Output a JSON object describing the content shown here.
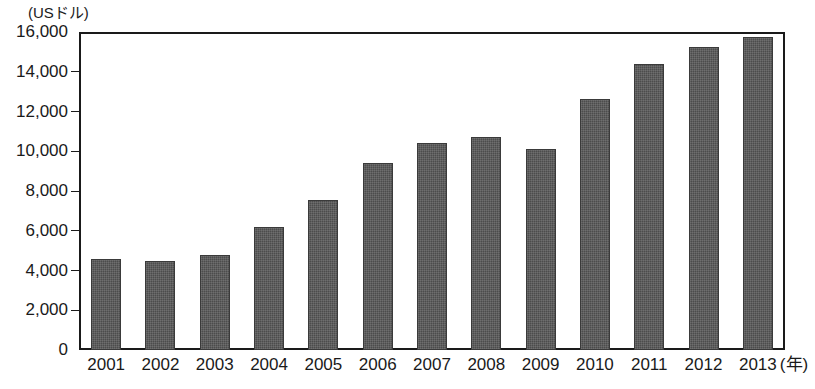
{
  "chart_data": {
    "type": "bar",
    "title": "【世界の人口動態と経済成長の推移】",
    "title_visible": false,
    "ylabel": "(USドル)",
    "xlabel": "(年)",
    "categories": [
      "2001",
      "2002",
      "2003",
      "2004",
      "2005",
      "2006",
      "2007",
      "2008",
      "2009",
      "2010",
      "2011",
      "2012",
      "2013"
    ],
    "values": [
      4600,
      4500,
      4800,
      6200,
      7550,
      9400,
      10400,
      10700,
      10100,
      12650,
      14400,
      15250,
      15750
    ],
    "ylim": [
      0,
      16000
    ],
    "ytick_values": [
      0,
      2000,
      4000,
      6000,
      8000,
      10000,
      12000,
      14000,
      16000
    ],
    "ytick_labels": [
      "0",
      "2,000",
      "4,000",
      "6,000",
      "8,000",
      "10,000",
      "12,000",
      "14,000",
      "16,000"
    ],
    "grid": true,
    "legend": false,
    "bar_color": "#4c4c4c",
    "axis_color": "#1a1a1a",
    "grid_color": "#6f6f6f",
    "background": "#ffffff"
  }
}
